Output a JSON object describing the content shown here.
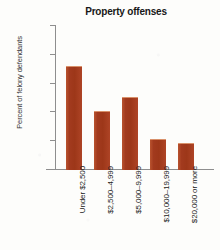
{
  "chart_data": {
    "type": "bar",
    "title": "Property offenses",
    "xlabel": "",
    "ylabel": "Percent of felony defendants",
    "categories": [
      "Under $2,500",
      "$2,500–4,999",
      "$5,000–9,999",
      "$10,000–19,999",
      "$20,000 or more"
    ],
    "values": [
      36,
      20.5,
      25.5,
      10.8,
      9.5
    ],
    "ylim": [
      0,
      50
    ],
    "yticks": [
      0,
      10,
      20,
      30,
      40,
      50
    ],
    "ytick_labels": [
      "0",
      "10",
      "20",
      "30",
      "40",
      "50"
    ],
    "grid": false,
    "legend": null,
    "bar_color": "#a63b20",
    "axis_color": "#8e8e8e",
    "background": "#fdfdfb"
  }
}
